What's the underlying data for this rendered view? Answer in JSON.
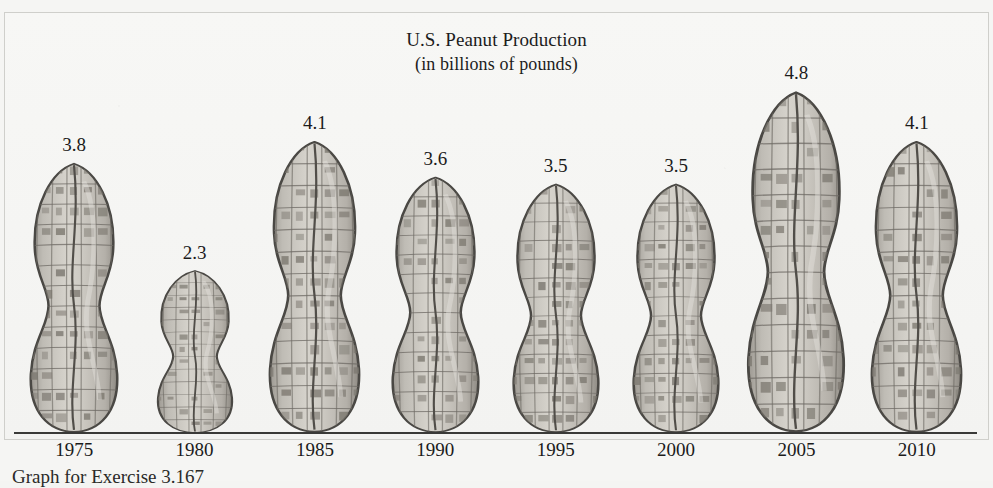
{
  "figure": {
    "title_line1": "U.S. Peanut Production",
    "title_line2": "(in billions of pounds)",
    "caption": "Graph for Exercise 3.167",
    "background_color": "#f5f5f3",
    "baseline_color": "#3a3a38",
    "peanut_fill": "#c9c6c0",
    "peanut_outline": "#4a4844",
    "text_color": "#1b1b1b"
  },
  "chart_data": {
    "type": "bar",
    "title": "U.S. Peanut Production (in billions of pounds)",
    "xlabel": "",
    "ylabel": "billions of pounds",
    "categories": [
      "1975",
      "1980",
      "1985",
      "1990",
      "1995",
      "2000",
      "2005",
      "2010"
    ],
    "values": [
      3.8,
      2.3,
      4.1,
      3.6,
      3.5,
      3.5,
      4.8,
      4.1
    ],
    "value_labels": [
      "3.8",
      "2.3",
      "4.1",
      "3.6",
      "3.5",
      "3.5",
      "4.8",
      "4.1"
    ],
    "ylim": [
      0,
      4.8
    ],
    "grid": false,
    "legend": false,
    "pictograph": "peanut"
  }
}
